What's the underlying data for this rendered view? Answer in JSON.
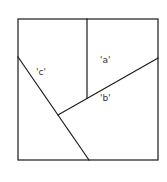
{
  "diagram": {
    "colors": {
      "stroke": "#1a1a1a",
      "label": "#333333",
      "background": "#ffffff"
    },
    "labels": {
      "a": "'a'",
      "b": "'b'",
      "c": "'c'"
    }
  }
}
